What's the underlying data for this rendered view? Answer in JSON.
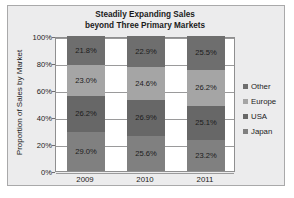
{
  "chart_data": {
    "type": "bar",
    "subtype": "stacked-100-percent",
    "title": "Steadily Expanding Sales beyond Three Primary Markets",
    "title_lines": [
      "Steadily Expanding Sales",
      "beyond Three Primary Markets"
    ],
    "xlabel": "",
    "ylabel": "Proportion of Sales by Market",
    "categories": [
      "2009",
      "2010",
      "2011"
    ],
    "ylim": [
      0,
      100
    ],
    "ytick_labels": [
      "0%",
      "20%",
      "40%",
      "60%",
      "80%",
      "100%"
    ],
    "ytick_values": [
      0,
      20,
      40,
      60,
      80,
      100
    ],
    "grid": true,
    "legend_position": "right",
    "legend_order": [
      "Other",
      "Europe",
      "USA",
      "Japan"
    ],
    "series": [
      {
        "name": "Japan",
        "color": "#808080",
        "values": [
          29.0,
          25.6,
          23.2
        ],
        "labels": [
          "29.0%",
          "25.6%",
          "23.2%"
        ]
      },
      {
        "name": "USA",
        "color": "#676767",
        "values": [
          26.2,
          26.9,
          25.1
        ],
        "labels": [
          "26.2%",
          "26.9%",
          "25.1%"
        ]
      },
      {
        "name": "Europe",
        "color": "#a5a5a5",
        "values": [
          23.0,
          24.6,
          26.2
        ],
        "labels": [
          "23.0%",
          "24.6%",
          "26.2%"
        ]
      },
      {
        "name": "Other",
        "color": "#6e6e6e",
        "values": [
          21.8,
          22.9,
          25.5
        ],
        "labels": [
          "21.8%",
          "22.9%",
          "25.5%"
        ]
      }
    ]
  },
  "figure": {
    "background_color": "#ececed",
    "plot_background_color": "#ffffff",
    "border_color": "#a9a9aa",
    "gridline_color": "#9a9a9b",
    "text_color": "#1b1b1b"
  }
}
